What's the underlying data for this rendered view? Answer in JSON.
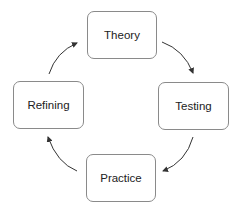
{
  "diagram": {
    "type": "cycle",
    "nodes": [
      {
        "id": "theory",
        "label": "Theory"
      },
      {
        "id": "testing",
        "label": "Testing"
      },
      {
        "id": "practice",
        "label": "Practice"
      },
      {
        "id": "refining",
        "label": "Refining"
      }
    ],
    "edges": [
      {
        "from": "theory",
        "to": "testing"
      },
      {
        "from": "testing",
        "to": "practice"
      },
      {
        "from": "practice",
        "to": "refining"
      },
      {
        "from": "refining",
        "to": "theory"
      }
    ],
    "colors": {
      "border": "#8a8a8a",
      "arrow": "#333333",
      "text": "#222222"
    }
  }
}
